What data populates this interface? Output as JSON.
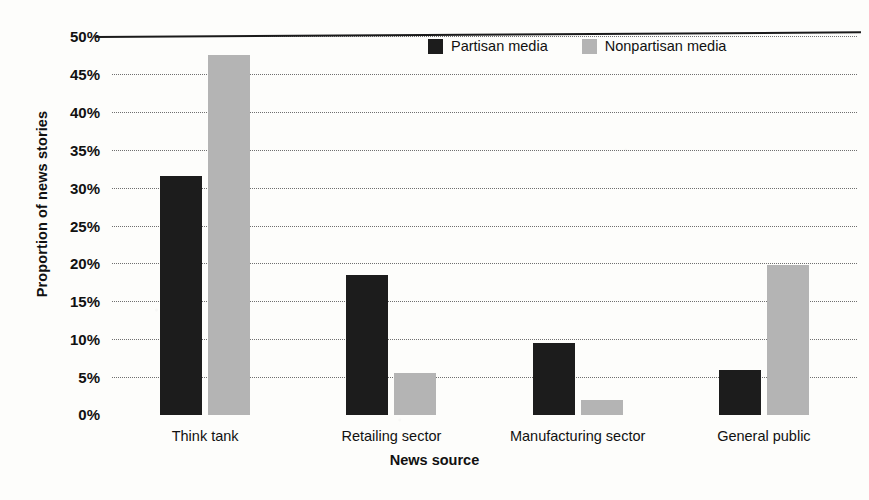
{
  "chart_data": {
    "type": "bar",
    "title": "",
    "xlabel": "News source",
    "ylabel": "Proportion of news stories",
    "categories": [
      "Think tank",
      "Retailing sector",
      "Manufacturing sector",
      "General public"
    ],
    "series": [
      {
        "name": "Partisan media",
        "color": "#1c1c1c",
        "values": [
          31.5,
          18.5,
          9.5,
          6.0
        ]
      },
      {
        "name": "Nonpartisan media",
        "color": "#b4b4b4",
        "values": [
          47.5,
          5.5,
          2.0,
          19.8
        ]
      }
    ],
    "ylim": [
      0,
      50
    ],
    "ytick_labels": [
      "50%",
      "45%",
      "40%",
      "35%",
      "30%",
      "25%",
      "20%",
      "15%",
      "10%",
      "5%",
      "0%"
    ],
    "ytick_values": [
      50,
      45,
      40,
      35,
      30,
      25,
      20,
      15,
      10,
      5,
      0
    ],
    "grid": true,
    "grid_style": "dotted",
    "legend_position": "top-center",
    "value_suffix": "%"
  }
}
